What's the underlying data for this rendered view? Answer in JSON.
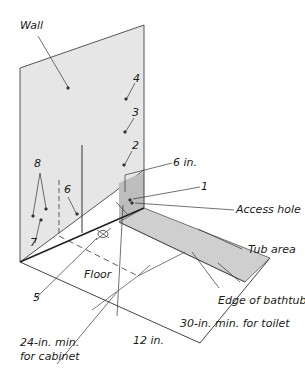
{
  "diagram": {
    "labels": {
      "wall": "Wall",
      "n4": "4",
      "n3": "3",
      "n2": "2",
      "six_in_upper": "6 in.",
      "n1": "1",
      "access_hole": "Access hole",
      "tub_area": "Tub area",
      "n8": "8",
      "n6": "6",
      "n7": "7",
      "floor": "Floor",
      "n5": "5",
      "edge_of_bathtub": "Edge of bathtub",
      "thirty_in": "30-in. min. for toilet",
      "twelve_in": "12 in.",
      "twentyfour_in_line1": "24-in. min.",
      "twentyfour_in_line2": "for cabinet"
    },
    "colors": {
      "wall_fill": "#e6e6e6",
      "tub_floor_fill": "#cfcfcf",
      "tub_wall_fill": "#bdbdbd",
      "line": "#333333"
    }
  }
}
